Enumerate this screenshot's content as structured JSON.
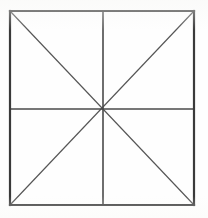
{
  "figure": {
    "canvas": {
      "width": 208,
      "height": 218,
      "background_color": "#fefefe"
    },
    "colors": {
      "border_stroke": "#3a3a3a",
      "midline_stroke": "#4a4a4a",
      "diagonal_stroke": "#555555",
      "background": "#fefefe"
    },
    "square": {
      "name": "outer-square",
      "left": 10,
      "top": 11,
      "right": 194,
      "bottom": 205,
      "width": 184,
      "height": 194,
      "stroke_width": 2.2,
      "stroke_color": "#3a3a3a"
    },
    "center_point": {
      "name": "center-vertex",
      "x": 103,
      "y": 109,
      "label": "center"
    },
    "corners": [
      {
        "name": "top-left",
        "x": 10,
        "y": 11
      },
      {
        "name": "top-right",
        "x": 194,
        "y": 11
      },
      {
        "name": "bottom-right",
        "x": 194,
        "y": 205
      },
      {
        "name": "bottom-left",
        "x": 10,
        "y": 205
      }
    ],
    "lines": [
      {
        "name": "border-top",
        "kind": "border",
        "x1": 10,
        "y1": 11,
        "x2": 194,
        "y2": 11,
        "stroke": "#3a3a3a",
        "stroke_width": 2.2
      },
      {
        "name": "border-right",
        "kind": "border",
        "x1": 194,
        "y1": 11,
        "x2": 194,
        "y2": 205,
        "stroke": "#3a3a3a",
        "stroke_width": 2.2
      },
      {
        "name": "border-bottom",
        "kind": "border",
        "x1": 194,
        "y1": 205,
        "x2": 10,
        "y2": 205,
        "stroke": "#3a3a3a",
        "stroke_width": 2.2
      },
      {
        "name": "border-left",
        "kind": "border",
        "x1": 10,
        "y1": 205,
        "x2": 10,
        "y2": 11,
        "stroke": "#3a3a3a",
        "stroke_width": 2.2
      },
      {
        "name": "vertical-midline",
        "kind": "midline",
        "x1": 103,
        "y1": 11,
        "x2": 103,
        "y2": 205,
        "stroke": "#4a4a4a",
        "stroke_width": 1.6
      },
      {
        "name": "horizontal-midline",
        "kind": "midline",
        "x1": 10,
        "y1": 109,
        "x2": 194,
        "y2": 109,
        "stroke": "#4a4a4a",
        "stroke_width": 1.6
      },
      {
        "name": "diagonal-tl-br",
        "kind": "diagonal",
        "x1": 10,
        "y1": 11,
        "x2": 194,
        "y2": 205,
        "stroke": "#555555",
        "stroke_width": 1.15
      },
      {
        "name": "diagonal-tr-bl",
        "kind": "diagonal",
        "x1": 194,
        "y1": 11,
        "x2": 10,
        "y2": 205,
        "stroke": "#555555",
        "stroke_width": 1.15
      }
    ],
    "counts": {
      "borders": 4,
      "midlines": 2,
      "diagonals": 2,
      "total_lines": 8,
      "triangular_regions": 8
    }
  }
}
